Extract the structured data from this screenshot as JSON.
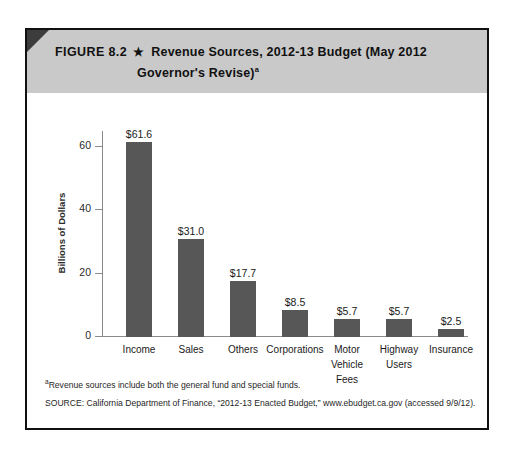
{
  "figure": {
    "label": "FIGURE 8.2",
    "star_icon": "★",
    "title_line1": "Revenue Sources, 2012-13 Budget (May 2012",
    "title_line2": "Governor's Revise)",
    "title_superscript": "a"
  },
  "notes": {
    "footnote_marker": "a",
    "footnote": "Revenue sources include both the general fund and special funds.",
    "source": "SOURCE: California Department of Finance, “2012-13 Enacted Budget,” www.ebudget.ca.gov (accessed 9/9/12)."
  },
  "colors": {
    "bar": "#575757",
    "header_band": "#c9c9c9",
    "frame": "#111111",
    "axis": "#8a8a8a",
    "corner_accent": "#3c3c3c"
  },
  "chart_data": {
    "type": "bar",
    "title": "Revenue Sources, 2012-13 Budget (May 2012 Governor's Revise)",
    "xlabel": "",
    "ylabel": "Billions of Dollars",
    "ylim": [
      0,
      65
    ],
    "yticks": [
      0,
      20,
      40,
      60
    ],
    "ytick_labels": [
      "0",
      "20",
      "40",
      "60"
    ],
    "grid": false,
    "legend": false,
    "categories": [
      "Income",
      "Sales",
      "Others",
      "Corporations",
      "Motor Vehicle Fees",
      "Highway Users",
      "Insurance"
    ],
    "category_label_lines": [
      [
        "Income"
      ],
      [
        "Sales"
      ],
      [
        "Others"
      ],
      [
        "Corporations"
      ],
      [
        "Motor",
        "Vehicle",
        "Fees"
      ],
      [
        "Highway",
        "Users"
      ],
      [
        "Insurance"
      ]
    ],
    "values": [
      61.6,
      31.0,
      17.7,
      8.5,
      5.7,
      5.7,
      2.5
    ],
    "data_labels": [
      "$61.6",
      "$31.0",
      "$17.7",
      "$8.5",
      "$5.7",
      "$5.7",
      "$2.5"
    ],
    "units": "Billions of Dollars"
  }
}
